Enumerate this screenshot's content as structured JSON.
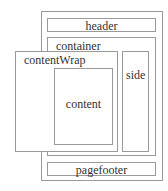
{
  "diagram": {
    "boxes": {
      "header": "header",
      "container": "container",
      "contentWrap": "contentWrap",
      "content": "content",
      "side": "side",
      "pagefooter": "pagefooter"
    }
  }
}
